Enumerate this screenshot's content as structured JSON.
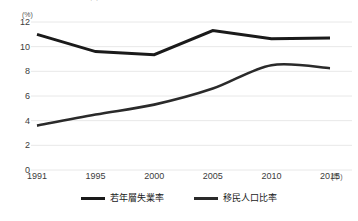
{
  "chart_data": {
    "type": "line",
    "title": "若年層失業率と移民人口比率の推移",
    "xlabel": "(年)",
    "ylabel": "(%)",
    "x": [
      1991,
      1995,
      2000,
      2005,
      2010,
      2015
    ],
    "categories": [
      "1991",
      "1995",
      "2000",
      "2005",
      "2010",
      "2015"
    ],
    "ylim": [
      0,
      12
    ],
    "ytick_values": [
      0,
      2,
      4,
      6,
      8,
      10,
      12
    ],
    "ytick_labels": [
      "0",
      "2",
      "4",
      "6",
      "8",
      "10",
      "12"
    ],
    "grid": "horizontal",
    "legend_position": "bottom-center",
    "series": [
      {
        "name": "若年層失業率",
        "values": [
          11.0,
          9.6,
          9.35,
          11.3,
          10.65,
          10.7
        ],
        "color": "#1a1a1a",
        "line_width": 3.0,
        "smooth": false
      },
      {
        "name": "移民人口比率",
        "values": [
          3.6,
          4.5,
          5.3,
          6.6,
          8.5,
          8.25
        ],
        "color": "#2a2a2a",
        "line_width": 2.6,
        "smooth": true
      }
    ],
    "grid_color": "#e8e8e8",
    "background_color": "#ffffff"
  },
  "axis": {
    "y_unit": "(%)",
    "x_unit": "(年)"
  }
}
